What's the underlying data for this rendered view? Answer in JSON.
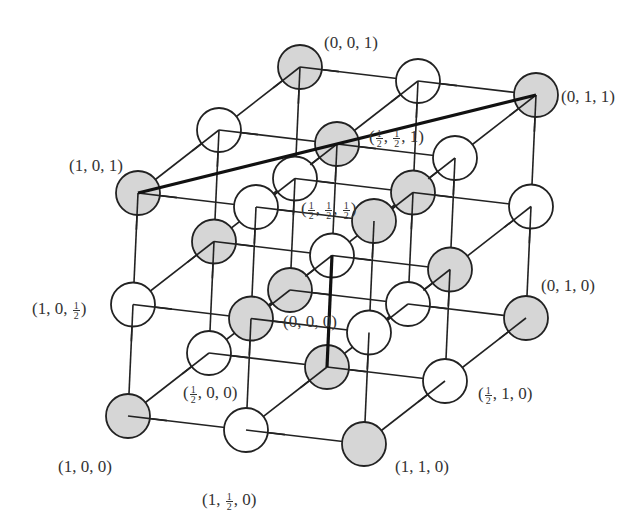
{
  "figure": {
    "atom_colors": {
      "gray": "#d6d6d6",
      "white": "#ffffff",
      "stroke": "#222222"
    },
    "labels": [
      {
        "id": "l001",
        "text": "(0, 0, 1)",
        "parts": [
          "(0, 0, 1)"
        ],
        "x": 324,
        "y": 34
      },
      {
        "id": "l011",
        "text": "(0, 1, 1)",
        "parts": [
          "(0, 1, 1)"
        ],
        "x": 561,
        "y": 88
      },
      {
        "id": "lhh1",
        "text": "(1/2, 1/2, 1)",
        "parts": [
          "(",
          "1|2",
          ", ",
          "1|2",
          ", 1)"
        ],
        "x": 369,
        "y": 128
      },
      {
        "id": "l101",
        "text": "(1, 0, 1)",
        "parts": [
          "(1, 0, 1)"
        ],
        "x": 69,
        "y": 157
      },
      {
        "id": "lhhh",
        "text": "(1/2, 1/2, 1/2)",
        "parts": [
          "(",
          "1|2",
          ", ",
          "1|2",
          ", ",
          "1|2",
          ")"
        ],
        "x": 301,
        "y": 200
      },
      {
        "id": "l010",
        "text": "(0, 1, 0)",
        "parts": [
          "(0, 1, 0)"
        ],
        "x": 541,
        "y": 277
      },
      {
        "id": "l10h",
        "text": "(1, 0, 1/2)",
        "parts": [
          "(1, 0, ",
          "1|2",
          ")"
        ],
        "x": 32,
        "y": 300
      },
      {
        "id": "l000",
        "text": "(0, 0, 0)",
        "parts": [
          "(0, 0, 0)"
        ],
        "x": 283,
        "y": 313
      },
      {
        "id": "lh00",
        "text": "(1/2, 0, 0)",
        "parts": [
          "(",
          "1|2",
          ", 0, 0)"
        ],
        "x": 183,
        "y": 384
      },
      {
        "id": "lh10",
        "text": "(1/2, 1, 0)",
        "parts": [
          "(",
          "1|2",
          ", 1, 0)"
        ],
        "x": 478,
        "y": 385
      },
      {
        "id": "l100",
        "text": "(1, 0, 0)",
        "parts": [
          "(1, 0, 0)"
        ],
        "x": 58,
        "y": 458
      },
      {
        "id": "l110",
        "text": "(1, 1, 0)",
        "parts": [
          "(1, 1, 0)"
        ],
        "x": 395,
        "y": 458
      },
      {
        "id": "l1h0",
        "text": "(1, 1/2, 0)",
        "parts": [
          "(1, ",
          "1|2",
          ", 0)"
        ],
        "x": 202,
        "y": 491
      }
    ]
  }
}
